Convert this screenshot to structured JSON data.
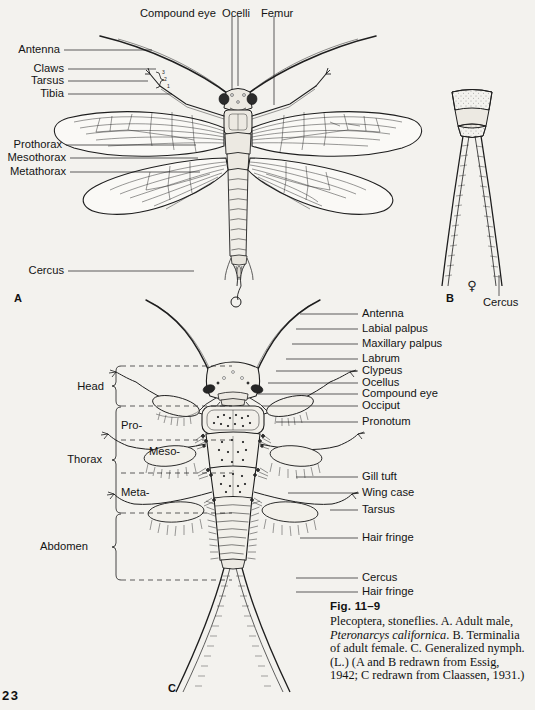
{
  "page": {
    "number": "23",
    "background": "#f3f2ee",
    "ink": "#141414"
  },
  "figure_a": {
    "key": "A",
    "top_labels": [
      {
        "text": "Compound eye",
        "x": 140,
        "y": 9,
        "line_x": 232,
        "line_y1": 16,
        "line_y2": 90
      },
      {
        "text": "Ocelli",
        "x": 222,
        "y": 9,
        "line_x": 238,
        "line_y1": 16,
        "line_y2": 86
      },
      {
        "text": "Femur",
        "x": 261,
        "y": 9,
        "line_x": 274,
        "line_y1": 16,
        "line_y2": 105
      }
    ],
    "left_labels": [
      {
        "text": "Antenna",
        "x": 17,
        "y": 50,
        "line_x1": 64,
        "line_x2": 152,
        "line_y": 50
      },
      {
        "text": "Claws",
        "x": 36,
        "y": 69,
        "line_x1": 68,
        "line_x2": 156,
        "line_y": 69
      },
      {
        "text": "Tarsus",
        "x": 31,
        "y": 81,
        "line_x1": 68,
        "line_x2": 148,
        "line_y": 81
      },
      {
        "text": "Tibia",
        "x": 40,
        "y": 94,
        "line_x1": 68,
        "line_x2": 172,
        "line_y": 94
      },
      {
        "text": "Prothorax",
        "x": 9,
        "y": 145,
        "line_x1": 66,
        "line_x2": 196,
        "line_y": 145
      },
      {
        "text": "Mesothorax",
        "x": 2,
        "y": 158,
        "line_x1": 70,
        "line_x2": 198,
        "line_y": 158
      },
      {
        "text": "Metathorax",
        "x": 3,
        "y": 172,
        "line_x1": 70,
        "line_x2": 200,
        "line_y": 172
      },
      {
        "text": "Cercus",
        "x": 27,
        "y": 271,
        "line_x1": 68,
        "line_x2": 194,
        "line_y": 271
      }
    ],
    "tarsus_segments": [
      "3",
      "2",
      "1"
    ]
  },
  "figure_b": {
    "key": "B",
    "sex_symbol": "♀",
    "labels": [
      {
        "text": "Cercus",
        "x": 483,
        "y": 303,
        "line_x": 499,
        "line_y1": 275,
        "line_y2": 294
      }
    ]
  },
  "figure_c": {
    "key": "C",
    "right_labels": [
      {
        "text": "Antenna",
        "x": 362,
        "y": 314,
        "line_x1": 300,
        "line_x2": 358,
        "line_y": 314
      },
      {
        "text": "Labial palpus",
        "x": 362,
        "y": 329,
        "line_x1": 296,
        "line_x2": 358,
        "line_y": 329
      },
      {
        "text": "Maxillary palpus",
        "x": 362,
        "y": 344,
        "line_x1": 292,
        "line_x2": 358,
        "line_y": 344
      },
      {
        "text": "Labrum",
        "x": 362,
        "y": 359,
        "line_x1": 286,
        "line_x2": 358,
        "line_y": 359
      },
      {
        "text": "Clypeus",
        "x": 362,
        "y": 371,
        "line_x1": 276,
        "line_x2": 358,
        "line_y": 371
      },
      {
        "text": "Ocellus",
        "x": 362,
        "y": 383,
        "line_x1": 268,
        "line_x2": 358,
        "line_y": 383
      },
      {
        "text": "Compound eye",
        "x": 362,
        "y": 394,
        "line_x1": 258,
        "line_x2": 358,
        "line_y": 394
      },
      {
        "text": "Occiput",
        "x": 362,
        "y": 406,
        "line_x1": 262,
        "line_x2": 358,
        "line_y": 406
      },
      {
        "text": "Pronotum",
        "x": 362,
        "y": 422,
        "line_x1": 276,
        "line_x2": 358,
        "line_y": 422
      },
      {
        "text": "Gill tuft",
        "x": 362,
        "y": 477,
        "line_x1": 296,
        "line_x2": 358,
        "line_y": 477
      },
      {
        "text": "Wing case",
        "x": 362,
        "y": 493,
        "line_x1": 288,
        "line_x2": 358,
        "line_y": 493
      },
      {
        "text": "Tarsus",
        "x": 362,
        "y": 510,
        "line_x1": 330,
        "line_x2": 358,
        "line_y": 510
      },
      {
        "text": "Hair fringe",
        "x": 362,
        "y": 538,
        "line_x1": 300,
        "line_x2": 358,
        "line_y": 538
      },
      {
        "text": "Cercus",
        "x": 362,
        "y": 578,
        "line_x1": 296,
        "line_x2": 358,
        "line_y": 578
      },
      {
        "text": "Hair fringe",
        "x": 362,
        "y": 592,
        "line_x1": 296,
        "line_x2": 358,
        "line_y": 592
      }
    ],
    "brackets": [
      {
        "text": "Head",
        "x": 104,
        "y": 386,
        "top": 366,
        "bottom": 406,
        "bx": 116
      },
      {
        "text": "Thorax",
        "x": 102,
        "y": 459,
        "top": 407,
        "bottom": 513,
        "bx": 116
      },
      {
        "text": "Abdomen",
        "x": 88,
        "y": 546,
        "top": 514,
        "bottom": 580,
        "bx": 116
      }
    ],
    "segment_labels": [
      {
        "text": "Pro-",
        "x": 121,
        "y": 425
      },
      {
        "text": "Meso-",
        "x": 149,
        "y": 451
      },
      {
        "text": "Meta-",
        "x": 121,
        "y": 492
      }
    ],
    "dashed_rows": [
      366,
      406,
      440,
      473,
      513,
      580
    ]
  },
  "caption": {
    "fig_number": "Fig. 11–9",
    "line1_a": "Plecoptera, stoneflies. A. Adult male,",
    "species": "Pteronarcys californica",
    "line2_b": ". B. Terminalia",
    "line3": "of adult female. C. Generalized",
    "line4": "nymph. (L.) (A and B redrawn from",
    "line5": "Essig, 1942; C redrawn from Claassen,",
    "line6": "1931.)"
  }
}
